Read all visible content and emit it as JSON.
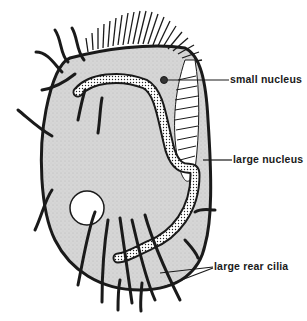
{
  "diagram": {
    "labels": [
      {
        "id": "small-nucleus",
        "text": "small nucleus"
      },
      {
        "id": "large-nucleus",
        "text": "large nucleus"
      },
      {
        "id": "large-rear-cilia",
        "text": "large rear cilia"
      }
    ],
    "colors": {
      "body_fill": "#d9d9d9",
      "outline": "#1a1a1a",
      "background": "#ffffff"
    }
  }
}
